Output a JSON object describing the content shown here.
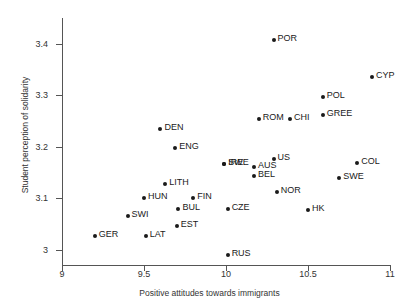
{
  "chart_data": {
    "type": "scatter",
    "title": "",
    "xlabel": "Positive attitudes towards immigrants",
    "ylabel": "Student perception of solidarity",
    "xlim": [
      9,
      11
    ],
    "ylim": [
      2.97,
      3.45
    ],
    "xticks": [
      "9",
      "9.5",
      "10",
      "10.5",
      "11"
    ],
    "xtick_values": [
      9,
      9.5,
      10,
      10.5,
      11
    ],
    "yticks": [
      "3",
      "3.1",
      "3.2",
      "3.3",
      "3.4"
    ],
    "ytick_values": [
      3,
      3.1,
      3.2,
      3.3,
      3.4
    ],
    "grid": false,
    "legend": null,
    "points": [
      {
        "label": "POR",
        "x": 10.29,
        "y": 3.407
      },
      {
        "label": "CYP",
        "x": 10.89,
        "y": 3.335
      },
      {
        "label": "POL",
        "x": 10.59,
        "y": 3.296
      },
      {
        "label": "GREE",
        "x": 10.59,
        "y": 3.262
      },
      {
        "label": "ROM",
        "x": 10.2,
        "y": 3.254
      },
      {
        "label": "CHI",
        "x": 10.39,
        "y": 3.254
      },
      {
        "label": "DEN",
        "x": 9.6,
        "y": 3.235
      },
      {
        "label": "ENG",
        "x": 9.69,
        "y": 3.197
      },
      {
        "label": "SWE",
        "x": 9.99,
        "y": 3.166
      },
      {
        "label": "IRE",
        "x": 9.99,
        "y": 3.166
      },
      {
        "label": "US",
        "x": 10.29,
        "y": 3.176
      },
      {
        "label": "COL",
        "x": 10.8,
        "y": 3.168
      },
      {
        "label": "AUS",
        "x": 10.17,
        "y": 3.16
      },
      {
        "label": "BEL",
        "x": 10.17,
        "y": 3.143
      },
      {
        "label": "SWE",
        "x": 10.69,
        "y": 3.14
      },
      {
        "label": "LITH",
        "x": 9.63,
        "y": 3.128
      },
      {
        "label": "HUN",
        "x": 9.5,
        "y": 3.1
      },
      {
        "label": "FIN",
        "x": 9.8,
        "y": 3.1
      },
      {
        "label": "NOR",
        "x": 10.31,
        "y": 3.112
      },
      {
        "label": "BUL",
        "x": 9.71,
        "y": 3.078
      },
      {
        "label": "SWI",
        "x": 9.4,
        "y": 3.065
      },
      {
        "label": "CZE",
        "x": 10.01,
        "y": 3.078
      },
      {
        "label": "HK",
        "x": 10.5,
        "y": 3.076
      },
      {
        "label": "EST",
        "x": 9.7,
        "y": 3.045
      },
      {
        "label": "GER",
        "x": 9.2,
        "y": 3.026
      },
      {
        "label": "LAT",
        "x": 9.51,
        "y": 3.026
      },
      {
        "label": "RUS",
        "x": 10.01,
        "y": 2.99
      }
    ]
  }
}
